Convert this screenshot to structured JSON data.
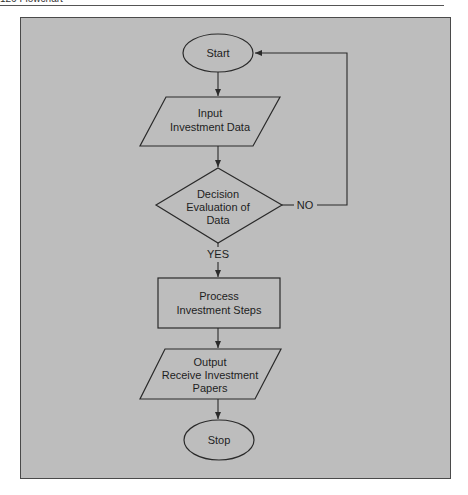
{
  "page": {
    "header_text": "126   Flowchart"
  },
  "diagram": {
    "type": "flowchart",
    "colors": {
      "panel_bg": "#bdbdbd",
      "stroke": "#2a2a2a",
      "text": "#1e1e1e"
    },
    "nodes": {
      "start": {
        "shape": "ellipse",
        "lines": [
          "Start"
        ]
      },
      "input": {
        "shape": "parallelogram",
        "lines": [
          "Input",
          "Investment Data"
        ]
      },
      "decision": {
        "shape": "diamond",
        "lines": [
          "Decision",
          "Evaluation of",
          "Data"
        ]
      },
      "process": {
        "shape": "rectangle",
        "lines": [
          "Process",
          "Investment Steps"
        ]
      },
      "output": {
        "shape": "parallelogram",
        "lines": [
          "Output",
          "Receive Investment",
          "Papers"
        ]
      },
      "stop": {
        "shape": "ellipse",
        "lines": [
          "Stop"
        ]
      }
    },
    "edges": {
      "no_label": "NO",
      "yes_label": "YES"
    },
    "edge_list": [
      {
        "from": "start",
        "to": "input"
      },
      {
        "from": "input",
        "to": "decision"
      },
      {
        "from": "decision",
        "to": "process",
        "label": "YES"
      },
      {
        "from": "decision",
        "to": "start",
        "label": "NO"
      },
      {
        "from": "process",
        "to": "output"
      },
      {
        "from": "output",
        "to": "stop"
      }
    ]
  }
}
